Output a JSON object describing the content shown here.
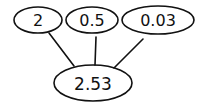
{
  "diagram": {
    "type": "sum-tree",
    "inputs": [
      {
        "label": "2"
      },
      {
        "label": "0.5"
      },
      {
        "label": "0.03"
      }
    ],
    "output": {
      "label": "2.53"
    }
  }
}
